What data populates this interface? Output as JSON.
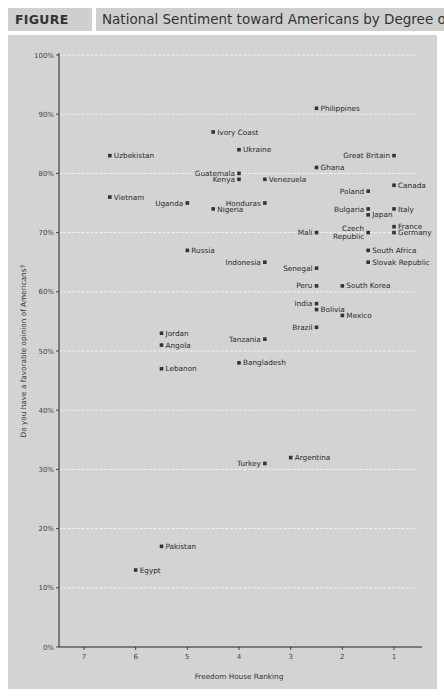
{
  "figure": {
    "label": "FIGURE 6.2",
    "title": "National Sentiment toward Americans by Degree of Democracy"
  },
  "colors": {
    "header_bg": "#cfcfcf",
    "panel_bg": "#d3d3d3",
    "gridline": "#f2f2f2",
    "axis": "#222222",
    "marker": "#333333"
  },
  "chart_data": {
    "type": "scatter",
    "title": "National Sentiment toward Americans by Degree of Democracy",
    "xlabel": "Freedom House Ranking",
    "ylabel": "Do you have a favorable  opinion of Americans?",
    "xlim": [
      7.5,
      0.5
    ],
    "x_reversed": true,
    "ylim": [
      0,
      100
    ],
    "x_ticks": [
      7,
      6,
      5,
      4,
      3,
      2,
      1
    ],
    "y_ticks": [
      "0%",
      "10%",
      "20%",
      "30%",
      "40%",
      "50%",
      "60%",
      "70%",
      "80%",
      "90%",
      "100%"
    ],
    "grid": "horizontal dashed white",
    "points": [
      {
        "name": "Philippines",
        "x": 2.5,
        "y": 91,
        "label_side": "right"
      },
      {
        "name": "Ivory Coast",
        "x": 4.5,
        "y": 87,
        "label_side": "right"
      },
      {
        "name": "Ukraine",
        "x": 4,
        "y": 84,
        "label_side": "right"
      },
      {
        "name": "Uzbekistan",
        "x": 6.5,
        "y": 83,
        "label_side": "right"
      },
      {
        "name": "Great Britain",
        "x": 1,
        "y": 83,
        "label_side": "left"
      },
      {
        "name": "Ghana",
        "x": 2.5,
        "y": 81,
        "label_side": "right"
      },
      {
        "name": "Guatemala",
        "x": 4,
        "y": 80,
        "label_side": "left"
      },
      {
        "name": "Kenya",
        "x": 4,
        "y": 79,
        "label_side": "left"
      },
      {
        "name": "Venezuela",
        "x": 3.5,
        "y": 79,
        "label_side": "right"
      },
      {
        "name": "Canada",
        "x": 1,
        "y": 78,
        "label_side": "right"
      },
      {
        "name": "Poland",
        "x": 1.5,
        "y": 77,
        "label_side": "left"
      },
      {
        "name": "Vietnam",
        "x": 6.5,
        "y": 76,
        "label_side": "right"
      },
      {
        "name": "Uganda",
        "x": 5,
        "y": 75,
        "label_side": "left"
      },
      {
        "name": "Honduras",
        "x": 3.5,
        "y": 75,
        "label_side": "left"
      },
      {
        "name": "Nigeria",
        "x": 4.5,
        "y": 74,
        "label_side": "right"
      },
      {
        "name": "Bulgaria",
        "x": 1.5,
        "y": 74,
        "label_side": "left"
      },
      {
        "name": "Italy",
        "x": 1,
        "y": 74,
        "label_side": "right"
      },
      {
        "name": "Japan",
        "x": 1.5,
        "y": 73,
        "label_side": "right"
      },
      {
        "name": "France",
        "x": 1,
        "y": 71,
        "label_side": "right"
      },
      {
        "name": "Mali",
        "x": 2.5,
        "y": 70,
        "label_side": "left"
      },
      {
        "name": "Czech Republic",
        "x": 1.5,
        "y": 70,
        "label_side": "left"
      },
      {
        "name": "Germany",
        "x": 1,
        "y": 70,
        "label_side": "right"
      },
      {
        "name": "Russia",
        "x": 5,
        "y": 67,
        "label_side": "right"
      },
      {
        "name": "South Africa",
        "x": 1.5,
        "y": 67,
        "label_side": "right"
      },
      {
        "name": "Indonesia",
        "x": 3.5,
        "y": 65,
        "label_side": "left"
      },
      {
        "name": "Slovak Republic",
        "x": 1.5,
        "y": 65,
        "label_side": "right"
      },
      {
        "name": "Senegal",
        "x": 2.5,
        "y": 64,
        "label_side": "left"
      },
      {
        "name": "Peru",
        "x": 2.5,
        "y": 61,
        "label_side": "left"
      },
      {
        "name": "South Korea",
        "x": 2,
        "y": 61,
        "label_side": "right"
      },
      {
        "name": "India",
        "x": 2.5,
        "y": 58,
        "label_side": "left"
      },
      {
        "name": "Bolivia",
        "x": 2.5,
        "y": 57,
        "label_side": "right"
      },
      {
        "name": "Mexico",
        "x": 2,
        "y": 56,
        "label_side": "right"
      },
      {
        "name": "Brazil",
        "x": 2.5,
        "y": 54,
        "label_side": "left"
      },
      {
        "name": "Jordan",
        "x": 5.5,
        "y": 53,
        "label_side": "right"
      },
      {
        "name": "Tanzania",
        "x": 3.5,
        "y": 52,
        "label_side": "left"
      },
      {
        "name": "Angola",
        "x": 5.5,
        "y": 51,
        "label_side": "right"
      },
      {
        "name": "Bangladesh",
        "x": 4,
        "y": 48,
        "label_side": "right"
      },
      {
        "name": "Lebanon",
        "x": 5.5,
        "y": 47,
        "label_side": "right"
      },
      {
        "name": "Argentina",
        "x": 3,
        "y": 32,
        "label_side": "right"
      },
      {
        "name": "Turkey",
        "x": 3.5,
        "y": 31,
        "label_side": "left"
      },
      {
        "name": "Pakistan",
        "x": 5.5,
        "y": 17,
        "label_side": "right"
      },
      {
        "name": "Egypt",
        "x": 6,
        "y": 13,
        "label_side": "right"
      }
    ]
  }
}
